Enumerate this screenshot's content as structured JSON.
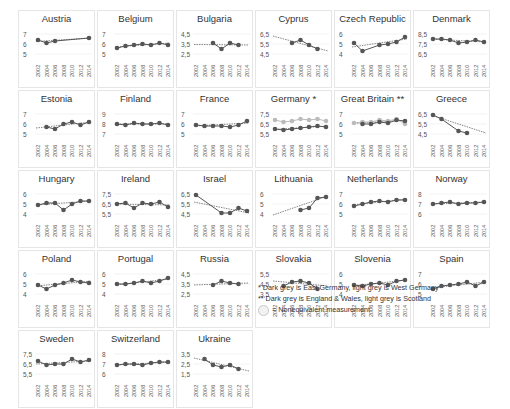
{
  "chart_data": {
    "type": "line",
    "title": "",
    "x": [
      2002,
      2004,
      2006,
      2008,
      2010,
      2012,
      2014
    ],
    "x_tick_labels": [
      "2002",
      "2004",
      "2006",
      "2008",
      "2010",
      "2012",
      "2014"
    ],
    "panels": [
      {
        "name": "Austria",
        "yticks": [
          5,
          6,
          7
        ],
        "ylim": [
          5,
          7
        ],
        "series": [
          {
            "name": "main",
            "color": "#555",
            "values": [
              6.4,
              6.1,
              6.3,
              null,
              null,
              null,
              6.6
            ]
          }
        ],
        "trend": [
          6.25,
          6.6
        ]
      },
      {
        "name": "Belgium",
        "yticks": [
          5,
          6,
          7
        ],
        "ylim": [
          5,
          7
        ],
        "series": [
          {
            "name": "main",
            "color": "#555",
            "values": [
              5.6,
              5.8,
              5.9,
              6.0,
              5.9,
              6.1,
              5.9
            ]
          }
        ],
        "trend": [
          5.7,
          6.1
        ]
      },
      {
        "name": "Bulgaria",
        "yticks": [
          2.5,
          3.5,
          4.5
        ],
        "ylim": [
          2.5,
          4.5
        ],
        "series": [
          {
            "name": "main",
            "color": "#555",
            "values": [
              null,
              null,
              3.6,
              3.0,
              3.6,
              3.4,
              null
            ]
          }
        ],
        "trend": [
          3.45,
          3.4
        ]
      },
      {
        "name": "Cyprus",
        "yticks": [
          4.5,
          5.5,
          6.5
        ],
        "ylim": [
          4.5,
          6.5
        ],
        "series": [
          {
            "name": "main",
            "color": "#555",
            "values": [
              null,
              null,
              5.6,
              5.9,
              5.4,
              5.0,
              null
            ]
          }
        ],
        "trend": [
          6.3,
          4.8
        ]
      },
      {
        "name": "Czech Republic",
        "yticks": [
          4,
          5,
          6
        ],
        "ylim": [
          4,
          6
        ],
        "series": [
          {
            "name": "main",
            "color": "#555",
            "values": [
              5.1,
              4.3,
              null,
              4.9,
              5.0,
              5.2,
              5.7
            ]
          }
        ],
        "trend": [
          4.7,
          5.5
        ]
      },
      {
        "name": "Denmark",
        "yticks": [
          6.5,
          7.5,
          8.5
        ],
        "ylim": [
          6.5,
          8.5
        ],
        "series": [
          {
            "name": "main",
            "color": "#555",
            "values": [
              8.0,
              8.0,
              7.9,
              7.6,
              7.7,
              7.9,
              7.7
            ]
          }
        ],
        "trend": [
          8.0,
          7.7
        ]
      },
      {
        "name": "Estonia",
        "yticks": [
          5,
          6,
          7
        ],
        "ylim": [
          5,
          7
        ],
        "series": [
          {
            "name": "main",
            "color": "#555",
            "values": [
              null,
              5.7,
              5.5,
              6.0,
              6.2,
              5.9,
              6.2
            ]
          }
        ],
        "trend": [
          5.6,
          6.2
        ]
      },
      {
        "name": "Finland",
        "yticks": [
          7,
          8,
          9
        ],
        "ylim": [
          7,
          9
        ],
        "series": [
          {
            "name": "main",
            "color": "#555",
            "values": [
              8.0,
              7.9,
              8.1,
              8.0,
              8.0,
              8.1,
              7.9
            ]
          }
        ],
        "trend": [
          8.0,
          8.0
        ]
      },
      {
        "name": "France",
        "yticks": [
          5,
          6,
          7
        ],
        "ylim": [
          5,
          7
        ],
        "series": [
          {
            "name": "main",
            "color": "#555",
            "values": [
              5.9,
              5.8,
              5.8,
              5.8,
              5.7,
              5.9,
              6.3
            ]
          }
        ],
        "trend": [
          5.8,
          6.1
        ]
      },
      {
        "name": "Germany *",
        "yticks": [
          5.5,
          6.5,
          7.5
        ],
        "ylim": [
          5.5,
          7.5
        ],
        "series": [
          {
            "name": "East Germany",
            "color": "#555",
            "values": [
              6.0,
              5.9,
              6.0,
              6.1,
              6.2,
              6.3,
              6.2
            ]
          },
          {
            "name": "West Germany",
            "color": "#bbb",
            "values": [
              6.9,
              6.7,
              6.8,
              7.0,
              6.9,
              7.0,
              6.8
            ]
          }
        ],
        "trend": [
          5.95,
          6.3
        ]
      },
      {
        "name": "Great Britain **",
        "yticks": [
          5,
          6,
          7
        ],
        "ylim": [
          5,
          7
        ],
        "series": [
          {
            "name": "England & Wales",
            "color": "#555",
            "values": [
              null,
              6.0,
              6.0,
              6.2,
              6.1,
              6.4,
              6.3
            ]
          },
          {
            "name": "Scotland",
            "color": "#bbb",
            "values": [
              6.1,
              6.2,
              6.2,
              6.4,
              6.3,
              6.5,
              6.0
            ]
          }
        ],
        "trend": [
          6.05,
          6.35
        ]
      },
      {
        "name": "Greece",
        "yticks": [
          4.5,
          5.5,
          6.5
        ],
        "ylim": [
          4.5,
          6.5
        ],
        "series": [
          {
            "name": "main",
            "color": "#555",
            "values": [
              6.4,
              6.0,
              null,
              4.8,
              4.6,
              null,
              null
            ]
          }
        ],
        "trend": [
          6.4,
          4.6
        ]
      },
      {
        "name": "Hungary",
        "yticks": [
          4,
          5,
          6
        ],
        "ylim": [
          4,
          6
        ],
        "series": [
          {
            "name": "main",
            "color": "#555",
            "values": [
              4.9,
              5.1,
              5.1,
              4.4,
              5.0,
              5.3,
              5.3
            ]
          }
        ],
        "trend": [
          4.9,
          5.3
        ]
      },
      {
        "name": "Ireland",
        "yticks": [
          5.5,
          6.5,
          7.5
        ],
        "ylim": [
          5.5,
          7.5
        ],
        "series": [
          {
            "name": "main",
            "color": "#555",
            "values": [
              6.5,
              6.6,
              6.1,
              6.6,
              6.5,
              6.7,
              6.2
            ]
          }
        ],
        "trend": [
          6.5,
          6.4
        ]
      },
      {
        "name": "Israel",
        "yticks": [
          4.5,
          5.5,
          6.5
        ],
        "ylim": [
          4.5,
          6.5
        ],
        "series": [
          {
            "name": "main",
            "color": "#555",
            "values": [
              6.4,
              null,
              null,
              4.6,
              4.6,
              5.1,
              4.8
            ]
          }
        ],
        "trend": [
          5.7,
          4.6
        ]
      },
      {
        "name": "Lithuania",
        "yticks": [
          4,
          5,
          6
        ],
        "ylim": [
          4,
          6
        ],
        "series": [
          {
            "name": "main",
            "color": "#555",
            "values": [
              null,
              null,
              null,
              4.4,
              4.6,
              5.6,
              5.7
            ]
          }
        ],
        "trend": [
          3.9,
          5.8
        ]
      },
      {
        "name": "Netherlands",
        "yticks": [
          5,
          6,
          7
        ],
        "ylim": [
          5,
          7
        ],
        "series": [
          {
            "name": "main",
            "color": "#555",
            "values": [
              5.8,
              6.0,
              6.2,
              6.3,
              6.2,
              6.4,
              6.4
            ]
          }
        ],
        "trend": [
          5.9,
          6.5
        ]
      },
      {
        "name": "Norway",
        "yticks": [
          6,
          7,
          8
        ],
        "ylim": [
          6,
          8
        ],
        "series": [
          {
            "name": "main",
            "color": "#555",
            "values": [
              7.0,
              7.1,
              7.2,
              7.0,
              7.1,
              7.1,
              7.2
            ]
          }
        ],
        "trend": [
          7.0,
          7.2
        ]
      },
      {
        "name": "Poland",
        "yticks": [
          4,
          5,
          6
        ],
        "ylim": [
          4,
          6
        ],
        "series": [
          {
            "name": "main",
            "color": "#555",
            "values": [
              4.9,
              4.5,
              4.9,
              5.1,
              5.4,
              5.2,
              5.1
            ]
          }
        ],
        "trend": [
          4.8,
          5.3
        ]
      },
      {
        "name": "Portugal",
        "yticks": [
          4,
          5,
          6
        ],
        "ylim": [
          4,
          6
        ],
        "series": [
          {
            "name": "main",
            "color": "#555",
            "values": [
              5.0,
              5.0,
              5.1,
              5.3,
              5.1,
              5.3,
              5.6
            ]
          }
        ],
        "trend": [
          4.9,
          5.5
        ]
      },
      {
        "name": "Russia",
        "yticks": [
          2.5,
          3.5,
          4.5
        ],
        "ylim": [
          2.5,
          4.5
        ],
        "series": [
          {
            "name": "main",
            "color": "#555",
            "values": [
              null,
              null,
              3.4,
              3.8,
              3.6,
              3.5,
              null
            ]
          }
        ],
        "trend": [
          3.4,
          3.6
        ]
      },
      {
        "name": "Slovakia",
        "yticks": [
          3.5,
          4.5,
          5.5
        ],
        "ylim": [
          3.5,
          5.5
        ],
        "series": [
          {
            "name": "main",
            "color": "#555",
            "values": [
              null,
              4.3,
              4.7,
              4.8,
              4.6,
              4.0,
              null
            ]
          }
        ],
        "trend": [
          4.8,
          4.3
        ]
      },
      {
        "name": "Slovenia",
        "yticks": [
          4,
          5,
          6
        ],
        "ylim": [
          4,
          6
        ],
        "series": [
          {
            "name": "main",
            "color": "#555",
            "values": [
              4.9,
              4.8,
              5.0,
              5.1,
              4.9,
              5.3,
              5.4
            ]
          }
        ],
        "trend": [
          4.8,
          5.4
        ]
      },
      {
        "name": "Spain",
        "yticks": [
          5,
          6,
          7
        ],
        "ylim": [
          5,
          7
        ],
        "series": [
          {
            "name": "main",
            "color": "#555",
            "values": [
              5.5,
              5.8,
              5.9,
              6.0,
              6.2,
              5.8,
              6.2
            ]
          }
        ],
        "trend": [
          5.6,
          6.2
        ]
      },
      {
        "name": "Sweden",
        "yticks": [
          5.5,
          6.5,
          7.5
        ],
        "ylim": [
          5.5,
          7.5
        ],
        "series": [
          {
            "name": "main",
            "color": "#555",
            "values": [
              6.8,
              6.4,
              6.5,
              6.5,
              7.0,
              6.7,
              6.9
            ]
          }
        ],
        "trend": [
          6.5,
          6.8
        ]
      },
      {
        "name": "Switzerland",
        "yticks": [
          6,
          7,
          8
        ],
        "ylim": [
          6,
          8
        ],
        "series": [
          {
            "name": "main",
            "color": "#555",
            "values": [
              6.9,
              7.0,
              7.0,
              6.9,
              7.1,
              7.2,
              7.2
            ]
          }
        ],
        "trend": [
          6.9,
          7.2
        ]
      },
      {
        "name": "Ukraine",
        "yticks": [
          1.5,
          2.5,
          3.5
        ],
        "ylim": [
          1.5,
          3.5
        ],
        "series": [
          {
            "name": "main",
            "color": "#555",
            "values": [
              null,
              3.0,
              2.4,
              2.2,
              2.4,
              2.0,
              null
            ]
          }
        ],
        "trend": [
          3.1,
          1.8
        ]
      }
    ],
    "xlabel": "",
    "ylabel": "",
    "grid": true,
    "legend_position": "bottom-right"
  },
  "legend": {
    "line1": "*  Dark grey is East Germany, light grey is West Germany",
    "line2": "** Dark grey is England & Wales, light grey is Scotland",
    "line3": "= Nonequivalent measurement"
  }
}
